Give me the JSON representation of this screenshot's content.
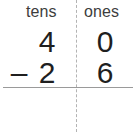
{
  "worksheet": {
    "headers": {
      "tens_label": "tens",
      "ones_label": "ones"
    },
    "minuend": {
      "tens": "4",
      "ones": "0"
    },
    "subtrahend": {
      "operator": "–",
      "tens": "2",
      "ones": "6"
    },
    "answer": {
      "tens": "",
      "ones": ""
    },
    "colors": {
      "digit": "#1f1f1f",
      "header": "#3d3d3d",
      "rule": "#9a9a9a",
      "divider": "#b3b3b3",
      "background": "#ffffff"
    }
  }
}
